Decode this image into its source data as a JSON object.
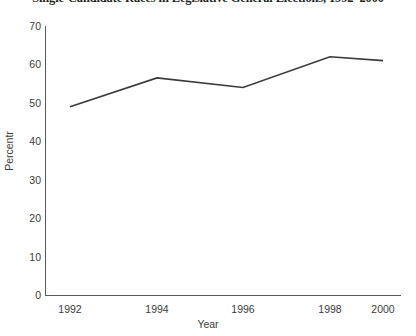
{
  "chart_data": {
    "type": "line",
    "title": "Single-Candidate Races in Legislative General Elections, 1992–2000",
    "xlabel": "Year",
    "ylabel": "Percentr",
    "categories": [
      "1992",
      "1994",
      "1996",
      "1998",
      "2000"
    ],
    "x": [
      1992,
      1994,
      1996,
      1998,
      2000
    ],
    "values": [
      49,
      56.5,
      54,
      62,
      61
    ],
    "series": [
      {
        "name": "Single-candidate races",
        "values": [
          49,
          56.5,
          54,
          62,
          61
        ]
      }
    ],
    "ylim": [
      0,
      70
    ],
    "yticks": [
      0,
      10,
      20,
      30,
      40,
      50,
      60,
      70
    ],
    "ytick_labels": [
      "0",
      "10",
      "20",
      "30",
      "40",
      "50",
      "60",
      "70"
    ],
    "xtick_labels": [
      "1992",
      "1994",
      "1996",
      "1998",
      "2000"
    ],
    "grid": false,
    "legend": false,
    "line_color": "#3b3b3d",
    "background_color": "#ffffff"
  }
}
